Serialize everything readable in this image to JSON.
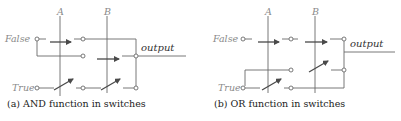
{
  "panels": [
    {
      "id": "a",
      "caption": "(a) AND function in switches",
      "labels": {
        "a": "A",
        "b": "B",
        "false": "False",
        "true": "True",
        "output": "output"
      }
    },
    {
      "id": "b",
      "caption": "(b) OR function in switches",
      "labels": {
        "a": "A",
        "b": "B",
        "false": "False",
        "true": "True",
        "output": "output"
      }
    }
  ],
  "colors": {
    "wire": "#6a6a6a",
    "switch": "#4a4a4a",
    "label": "#8a8a8a",
    "caption": "#222222"
  }
}
